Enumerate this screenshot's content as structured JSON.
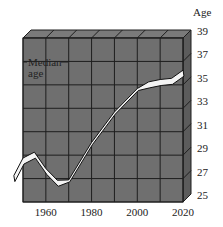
{
  "chart_data": {
    "type": "line",
    "title": "",
    "xlabel": "",
    "ylabel": "Age",
    "annotation": [
      "Median",
      "age"
    ],
    "x": [
      1946,
      1950,
      1955,
      1960,
      1965,
      1970,
      1980,
      1990,
      2000,
      2005,
      2010,
      2015,
      2020
    ],
    "series": [
      {
        "name": "Median age",
        "values": [
          27.0,
          28.5,
          29.0,
          27.6,
          26.6,
          26.8,
          30.0,
          32.6,
          34.6,
          35.0,
          35.2,
          35.3,
          36.0
        ]
      }
    ],
    "x_ticks": [
      "1960",
      "1980",
      "2000",
      "2020"
    ],
    "y_ticks": [
      "25",
      "27",
      "29",
      "31",
      "33",
      "35",
      "37",
      "39"
    ],
    "xlim": [
      1950,
      2020
    ],
    "ylim": [
      25,
      39
    ],
    "grid": true,
    "style": "3d-box"
  },
  "colors": {
    "face": "#6f6f6f",
    "side": "#5c5c5c",
    "top": "#7a7a7a",
    "grid": "#1e1e1e",
    "ribbon": "#f4f4f4"
  }
}
